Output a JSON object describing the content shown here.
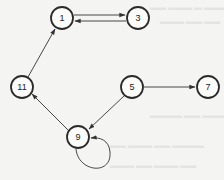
{
  "diagram": {
    "type": "directed-graph",
    "nodes": [
      {
        "id": "1",
        "label": "1",
        "x": 62,
        "y": 18
      },
      {
        "id": "3",
        "label": "3",
        "x": 138,
        "y": 18
      },
      {
        "id": "11",
        "label": "11",
        "x": 22,
        "y": 87
      },
      {
        "id": "5",
        "label": "5",
        "x": 132,
        "y": 87
      },
      {
        "id": "7",
        "label": "7",
        "x": 208,
        "y": 87
      },
      {
        "id": "9",
        "label": "9",
        "x": 78,
        "y": 137
      }
    ],
    "edges": [
      {
        "from": "1",
        "to": "3"
      },
      {
        "from": "3",
        "to": "1"
      },
      {
        "from": "11",
        "to": "1"
      },
      {
        "from": "5",
        "to": "7"
      },
      {
        "from": "5",
        "to": "9"
      },
      {
        "from": "9",
        "to": "11"
      },
      {
        "from": "9",
        "to": "9"
      }
    ],
    "colors": {
      "stroke": "#2a2a2a",
      "background": "#f4f4f2"
    }
  }
}
